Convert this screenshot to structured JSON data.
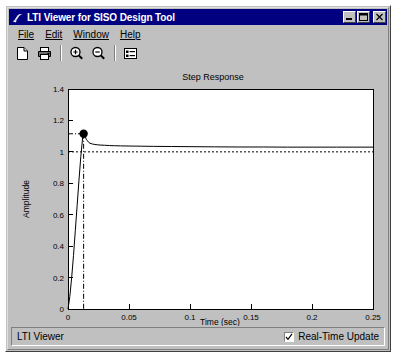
{
  "window": {
    "title": "LTI Viewer for SISO Design Tool",
    "icon": "matlab-figure-icon",
    "controls": [
      {
        "name": "minimize-button",
        "glyph": "minimize"
      },
      {
        "name": "maximize-button",
        "glyph": "maximize"
      },
      {
        "name": "close-button",
        "glyph": "close"
      }
    ]
  },
  "menu": {
    "items": [
      {
        "label": "File",
        "mnemonic": "F"
      },
      {
        "label": "Edit",
        "mnemonic": "E"
      },
      {
        "label": "Window",
        "mnemonic": "W"
      },
      {
        "label": "Help",
        "mnemonic": "H"
      }
    ]
  },
  "toolbar": {
    "buttons": [
      {
        "name": "new-document-button",
        "icon": "new-document-icon",
        "tooltip": "New"
      },
      {
        "name": "print-button",
        "icon": "printer-icon",
        "tooltip": "Print"
      },
      {
        "name": "zoom-in-button",
        "icon": "zoom-in-icon",
        "tooltip": "Zoom In"
      },
      {
        "name": "zoom-out-button",
        "icon": "zoom-out-icon",
        "tooltip": "Zoom Out"
      },
      {
        "name": "properties-button",
        "icon": "list-properties-icon",
        "tooltip": "Properties"
      }
    ]
  },
  "statusbar": {
    "text": "LTI Viewer",
    "realtime_update": {
      "label": "Real-Time Update",
      "checked": true
    }
  },
  "colors": {
    "window_face": "#c0c0c0",
    "titlebar": "#000080",
    "titlebar_text": "#ffffff",
    "plot_background": "#ffffff",
    "figure_background": "#c0c0c0",
    "curve": "#000000",
    "marker": "#000000",
    "steady_state_line": "#000000"
  },
  "chart_data": {
    "type": "line",
    "title": "Step Response",
    "xlabel": "Time (sec)",
    "ylabel": "Amplitude",
    "xlim": [
      0,
      0.25
    ],
    "ylim": [
      0,
      1.4
    ],
    "xticks": [
      0,
      0.05,
      0.1,
      0.15,
      0.2,
      0.25
    ],
    "xticklabels": [
      "0",
      "0.05",
      "0.1",
      "0.15",
      "0.2",
      "0.25"
    ],
    "yticks": [
      0,
      0.2,
      0.4,
      0.6,
      0.8,
      1,
      1.2,
      1.4
    ],
    "yticklabels": [
      "0",
      "0.2",
      "0.4",
      "0.6",
      "0.8",
      "1",
      "1.2",
      "1.4"
    ],
    "grid": false,
    "legend": null,
    "series": [
      {
        "name": "Step Response",
        "color": "#000000",
        "x": [
          0,
          0.0015,
          0.003,
          0.0045,
          0.006,
          0.0075,
          0.009,
          0.0105,
          0.012,
          0.0125,
          0.013,
          0.0135,
          0.014,
          0.0145,
          0.015,
          0.016,
          0.017,
          0.018,
          0.02,
          0.022,
          0.024,
          0.027,
          0.03,
          0.034,
          0.038,
          0.043,
          0.05,
          0.06,
          0.07,
          0.085,
          0.1,
          0.12,
          0.14,
          0.16,
          0.18,
          0.2,
          0.22,
          0.25
        ],
        "y": [
          0,
          0.08,
          0.2,
          0.34,
          0.5,
          0.66,
          0.82,
          0.97,
          1.09,
          1.11,
          1.115,
          1.11,
          1.1,
          1.09,
          1.08,
          1.07,
          1.06,
          1.055,
          1.05,
          1.047,
          1.045,
          1.043,
          1.042,
          1.04,
          1.039,
          1.038,
          1.037,
          1.036,
          1.035,
          1.034,
          1.033,
          1.032,
          1.031,
          1.031,
          1.03,
          1.03,
          1.03,
          1.03
        ]
      }
    ],
    "annotations": [
      {
        "name": "peak-response-marker",
        "type": "marker",
        "x": 0.0128,
        "y": 1.115,
        "style": "filled-circle",
        "guides": [
          "vertical-dashdot-to-x-axis",
          "horizontal-dashdot-to-y-axis"
        ]
      },
      {
        "name": "steady-state-line",
        "type": "hline",
        "y": 1.0,
        "style": "dotted"
      }
    ]
  }
}
